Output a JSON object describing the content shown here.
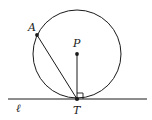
{
  "diagram": {
    "colors": {
      "stroke": "#1a1a1a",
      "background": "#ffffff"
    },
    "circle": {
      "center_label": "P",
      "cx": 77,
      "cy": 54,
      "r": 44
    },
    "points": {
      "A": {
        "label": "A",
        "x": 37,
        "y": 35
      },
      "P": {
        "label": "P",
        "x": 77,
        "y": 54
      },
      "T": {
        "label": "T",
        "x": 77,
        "y": 99
      }
    },
    "line": {
      "label": "ℓ",
      "x1": 8,
      "x2": 147,
      "y": 99
    },
    "segments": [
      "AT",
      "PT"
    ],
    "right_angle_at": "T"
  }
}
